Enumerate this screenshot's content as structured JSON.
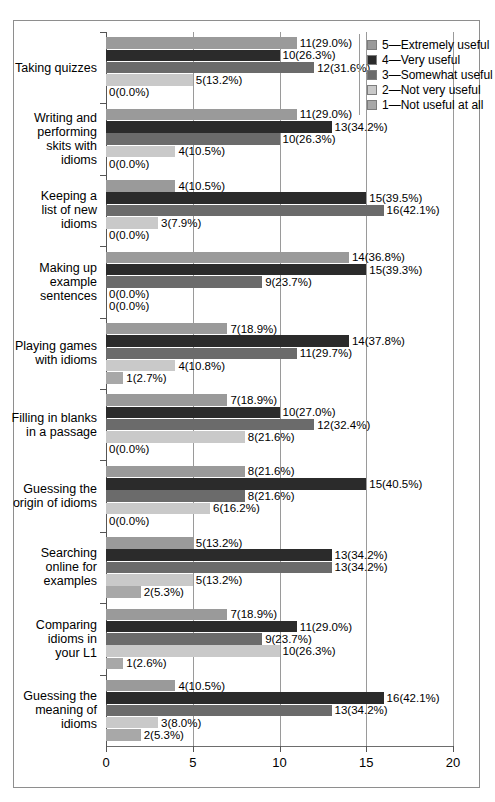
{
  "chart_data": {
    "type": "bar",
    "orientation": "horizontal",
    "title": "",
    "xlabel": "",
    "ylabel": "",
    "xlim": [
      0,
      20
    ],
    "xticks": [
      "0",
      "5",
      "10",
      "15",
      "20"
    ],
    "grid": true,
    "legend_position": "top-right",
    "legend": [
      {
        "key": "5",
        "label": "5—Extremely useful",
        "color": "#9a9a9a"
      },
      {
        "key": "4",
        "label": "4—Very useful",
        "color": "#2b2b2b"
      },
      {
        "key": "3",
        "label": "3—Somewhat useful",
        "color": "#6b6b6b"
      },
      {
        "key": "2",
        "label": "2—Not very useful",
        "color": "#c9c9c9"
      },
      {
        "key": "1",
        "label": "1—Not useful at all",
        "color": "#a8a8a8"
      }
    ],
    "categories": [
      "Taking quizzes",
      "Writing and\nperforming\nskits with\nidioms",
      "Keeping a\nlist of new\nidioms",
      "Making up\nexample\nsentences",
      "Playing games\nwith idioms",
      "Filling in blanks\nin a passage",
      "Guessing the\norigin of idioms",
      "Searching\nonline for\nexamples",
      "Comparing\nidioms in\nyour L1",
      "Guessing the\nmeaning of\nidioms"
    ],
    "series": [
      {
        "name": "5—Extremely useful",
        "values": [
          11,
          11,
          4,
          14,
          7,
          7,
          8,
          5,
          7,
          4
        ],
        "labels": [
          "11(29.0%)",
          "11(29.0%)",
          "4(10.5%)",
          "14(36.8%)",
          "7(18.9%)",
          "7(18.9%)",
          "8(21.6%)",
          "5(13.2%)",
          "7(18.9%)",
          "4(10.5%)"
        ]
      },
      {
        "name": "4—Very useful",
        "values": [
          10,
          13,
          15,
          15,
          14,
          10,
          15,
          13,
          11,
          16
        ],
        "labels": [
          "10(26.3%)",
          "13(34.2%)",
          "15(39.5%)",
          "15(39.3%)",
          "14(37.8%)",
          "10(27.0%)",
          "15(40.5%)",
          "13(34.2%)",
          "11(29.0%)",
          "16(42.1%)"
        ]
      },
      {
        "name": "3—Somewhat useful",
        "values": [
          12,
          10,
          16,
          9,
          11,
          12,
          8,
          13,
          9,
          13
        ],
        "labels": [
          "12(31.6%)",
          "10(26.3%)",
          "16(42.1%)",
          "9(23.7%)",
          "11(29.7%)",
          "12(32.4%)",
          "8(21.6%)",
          "13(34.2%)",
          "9(23.7%)",
          "13(34.2%)"
        ]
      },
      {
        "name": "2—Not very useful",
        "values": [
          5,
          4,
          3,
          0,
          4,
          8,
          6,
          5,
          10,
          3
        ],
        "labels": [
          "5(13.2%)",
          "4(10.5%)",
          "3(7.9%)",
          "0(0.0%)",
          "4(10.8%)",
          "8(21.6%)",
          "6(16.2%)",
          "5(13.2%)",
          "10(26.3%)",
          "3(8.0%)"
        ]
      },
      {
        "name": "1—Not useful at all",
        "values": [
          0,
          0,
          0,
          0,
          1,
          0,
          0,
          2,
          1,
          2
        ],
        "labels": [
          "0(0.0%)",
          "0(0.0%)",
          "0(0.0%)",
          "0(0.0%)",
          "1(2.7%)",
          "0(0.0%)",
          "0(0.0%)",
          "2(5.3%)",
          "1(2.6%)",
          "2(5.3%)"
        ]
      }
    ]
  }
}
